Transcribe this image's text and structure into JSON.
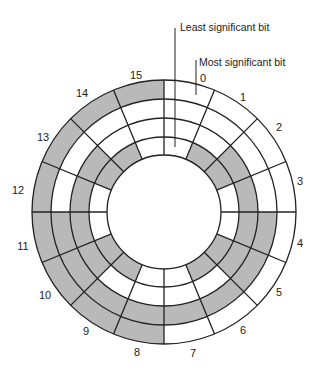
{
  "diagram": {
    "type": "gray-code-encoder-disk",
    "callouts": {
      "lsb": "Least significant bit",
      "msb": "Most significant bit"
    },
    "colors": {
      "line": "#222222",
      "shade": "#b9b9b9",
      "background": "#ffffff"
    },
    "geometry": {
      "cx": 164,
      "cy": 212,
      "radii": [
        132,
        113,
        94,
        75,
        57
      ]
    },
    "sectors": [
      {
        "label": "0",
        "code": "0000",
        "lx": 203,
        "ly": 82
      },
      {
        "label": "1",
        "code": "0001",
        "lx": 243,
        "ly": 101
      },
      {
        "label": "2",
        "code": "0011",
        "lx": 279,
        "ly": 131
      },
      {
        "label": "3",
        "code": "0010",
        "lx": 300,
        "ly": 185
      },
      {
        "label": "4",
        "code": "0110",
        "lx": 300,
        "ly": 247
      },
      {
        "label": "5",
        "code": "0111",
        "lx": 279,
        "ly": 296
      },
      {
        "label": "6",
        "code": "0101",
        "lx": 243,
        "ly": 334
      },
      {
        "label": "7",
        "code": "0100",
        "lx": 193,
        "ly": 357
      },
      {
        "label": "8",
        "code": "1100",
        "lx": 137,
        "ly": 356
      },
      {
        "label": "9",
        "code": "1101",
        "lx": 86,
        "ly": 335
      },
      {
        "label": "10",
        "code": "1111",
        "lx": 45,
        "ly": 299
      },
      {
        "label": "11",
        "code": "1110",
        "lx": 23,
        "ly": 250
      },
      {
        "label": "12",
        "code": "1010",
        "lx": 18,
        "ly": 194
      },
      {
        "label": "13",
        "code": "1011",
        "lx": 43,
        "ly": 141
      },
      {
        "label": "14",
        "code": "1001",
        "lx": 82,
        "ly": 97
      },
      {
        "label": "15",
        "code": "1000",
        "lx": 136,
        "ly": 79
      }
    ]
  }
}
